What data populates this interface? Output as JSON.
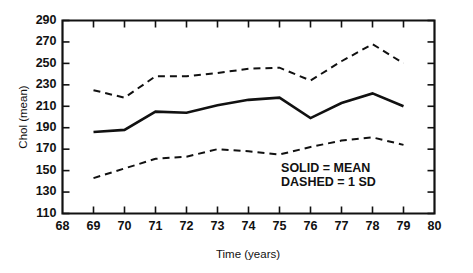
{
  "chart_data": {
    "type": "line",
    "title": "",
    "xlabel": "Time (years)",
    "ylabel": "Chol (mean)",
    "xlim": [
      68,
      80
    ],
    "ylim": [
      110,
      290
    ],
    "xticks": [
      68,
      69,
      70,
      71,
      72,
      73,
      74,
      75,
      76,
      77,
      78,
      79,
      80
    ],
    "yticks": [
      110,
      130,
      150,
      170,
      190,
      210,
      230,
      250,
      270,
      290
    ],
    "xtick_labels": [
      "68",
      "69",
      "70",
      "71",
      "72",
      "73",
      "74",
      "75",
      "76",
      "77",
      "78",
      "79",
      "80"
    ],
    "ytick_labels": [
      "110",
      "130",
      "150",
      "170",
      "190",
      "210",
      "230",
      "250",
      "270",
      "290"
    ],
    "grid": false,
    "legend_position": "inside-bottom-right",
    "x": [
      69,
      70,
      71,
      72,
      73,
      74,
      75,
      76,
      77,
      78,
      79
    ],
    "series": [
      {
        "name": "SOLID = MEAN",
        "style": "solid",
        "values": [
          186,
          188,
          205,
          204,
          211,
          216,
          218,
          199,
          213,
          222,
          210
        ]
      },
      {
        "name": "DASHED = 1 SD (upper)",
        "style": "dashed",
        "values": [
          225,
          218,
          238,
          238,
          241,
          245,
          246,
          234,
          252,
          268,
          250
        ]
      },
      {
        "name": "DASHED = 1 SD (lower)",
        "style": "dashed",
        "values": [
          143,
          152,
          161,
          163,
          170,
          168,
          165,
          172,
          178,
          181,
          174
        ]
      }
    ],
    "annotations": [
      {
        "text": "SOLID = MEAN",
        "x": 75.05,
        "y": 152
      },
      {
        "text": "DASHED = 1 SD",
        "x": 75.05,
        "y": 139
      }
    ],
    "colors": {
      "axis": "#111111",
      "mean_line": "#111111",
      "sd_line": "#111111",
      "background": "#ffffff"
    }
  }
}
